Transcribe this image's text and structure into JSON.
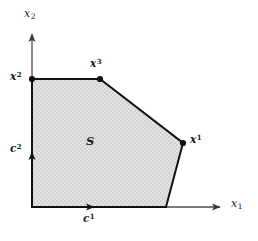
{
  "figure": {
    "background_color": "#ffffff",
    "width": 258,
    "height": 241
  },
  "axes": {
    "x_axis": {
      "label_base": "x",
      "label_sub": "1",
      "icon": "arrow-right-icon",
      "color": "#4d4d4d",
      "origin_px": [
        32,
        207
      ],
      "tip_px": [
        222,
        207
      ]
    },
    "y_axis": {
      "label_base": "x",
      "label_sub": "2",
      "icon": "arrow-up-icon",
      "color": "#4d4d4d",
      "origin_px": [
        32,
        207
      ],
      "tip_px": [
        32,
        32
      ]
    }
  },
  "region": {
    "name": "S",
    "label": "S",
    "fill_color": "#dcdcdc",
    "fill_pattern": "stipple",
    "edge_color": "#111111",
    "edge_width": 2,
    "vertices_px": [
      [
        32,
        79
      ],
      [
        100,
        79
      ],
      [
        183,
        143
      ],
      [
        166,
        207
      ],
      [
        32,
        207
      ]
    ],
    "label_px": [
      92,
      143
    ]
  },
  "extreme_points": [
    {
      "name": "x1",
      "label_base": "x",
      "label_sup": "1",
      "point_px": [
        183,
        143
      ],
      "label_px": [
        190,
        134
      ],
      "marker": "filled-dot"
    },
    {
      "name": "x2",
      "label_base": "x",
      "label_sup": "2",
      "point_px": [
        32,
        79
      ],
      "label_px": [
        10,
        71
      ],
      "marker": "filled-dot"
    },
    {
      "name": "x3",
      "label_base": "x",
      "label_sup": "3",
      "point_px": [
        100,
        79
      ],
      "label_px": [
        90,
        58
      ],
      "marker": "filled-dot"
    }
  ],
  "direction_vectors": [
    {
      "name": "c1",
      "label_base": "c",
      "label_sup": "1",
      "icon": "arrow-right-icon",
      "from_px": [
        32,
        207
      ],
      "to_px": [
        96,
        207
      ],
      "label_px": [
        83,
        213
      ],
      "color": "#111111"
    },
    {
      "name": "c2",
      "label_base": "c",
      "label_sup": "2",
      "icon": "arrow-up-icon",
      "from_px": [
        32,
        207
      ],
      "to_px": [
        32,
        150
      ],
      "label_px": [
        10,
        143
      ],
      "color": "#111111"
    }
  ],
  "colors": {
    "ink": "#111111",
    "axis": "#4d4d4d",
    "fill": "#dcdcdc",
    "background": "#ffffff"
  }
}
